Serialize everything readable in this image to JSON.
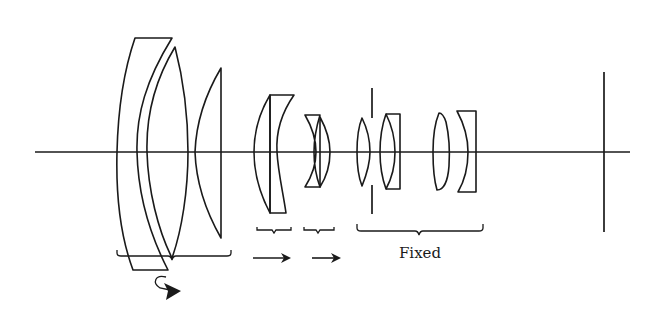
{
  "diagram": {
    "type": "optical-lens-layout",
    "colors": {
      "stroke": "#1a1a1a",
      "background": "#ffffff"
    },
    "groups": [
      {
        "id": "group1",
        "label": "",
        "motion": "rotating-focus",
        "icon": "curved-arrow-icon"
      },
      {
        "id": "group2",
        "label": "",
        "motion": "moves-right",
        "icon": "right-arrow-icon"
      },
      {
        "id": "group3",
        "label": "",
        "motion": "moves-right",
        "icon": "right-arrow-icon"
      },
      {
        "id": "group4",
        "label": "Fixed",
        "motion": "fixed"
      }
    ],
    "elements": [
      "optical-axis",
      "aperture-stop",
      "image-plane"
    ]
  }
}
